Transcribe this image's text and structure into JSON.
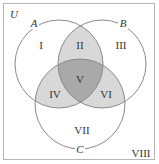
{
  "diagram": {
    "type": "venn-3-set",
    "universe_label": "U",
    "sets": [
      {
        "name": "A",
        "cx": 59,
        "cy": 64,
        "r": 44,
        "label_x": 34,
        "label_y": 27
      },
      {
        "name": "B",
        "cx": 102,
        "cy": 64,
        "r": 44,
        "label_x": 123,
        "label_y": 27
      },
      {
        "name": "C",
        "cx": 80,
        "cy": 104,
        "r": 45,
        "label_x": 80,
        "label_y": 153
      }
    ],
    "regions": [
      {
        "id": "I",
        "x": 41,
        "y": 49
      },
      {
        "id": "II",
        "x": 80,
        "y": 49
      },
      {
        "id": "III",
        "x": 121,
        "y": 49
      },
      {
        "id": "V",
        "x": 80,
        "y": 83
      },
      {
        "id": "IV",
        "x": 55,
        "y": 98
      },
      {
        "id": "VI",
        "x": 106,
        "y": 98
      },
      {
        "id": "VII",
        "x": 82,
        "y": 134
      },
      {
        "id": "VIII",
        "x": 141,
        "y": 157
      }
    ],
    "colors": {
      "pair_overlap": "#d8d8d8",
      "triple_overlap": "#a9a9a9",
      "circle_stroke": "#8a8a8a",
      "border": "#b5b5b5"
    }
  }
}
